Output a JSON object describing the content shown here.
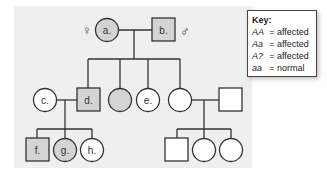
{
  "pedigree": {
    "symbols": {
      "female": "♀",
      "male": "♂"
    },
    "generation1": {
      "a": {
        "label": "a.",
        "sex": "female",
        "affected": true
      },
      "b": {
        "label": "b.",
        "sex": "male",
        "affected": true
      }
    },
    "generation2": [
      {
        "label": "c.",
        "sex": "female",
        "affected": false
      },
      {
        "label": "d.",
        "sex": "male",
        "affected": true
      },
      {
        "label": "",
        "sex": "female",
        "affected": true
      },
      {
        "label": "e.",
        "sex": "female",
        "affected": false
      },
      {
        "label": "",
        "sex": "female",
        "affected": false
      },
      {
        "label": "",
        "sex": "male",
        "affected": false
      }
    ],
    "generation3": [
      {
        "label": "f.",
        "sex": "male",
        "affected": true
      },
      {
        "label": "g.",
        "sex": "female",
        "affected": true
      },
      {
        "label": "h.",
        "sex": "female",
        "affected": false
      },
      {
        "label": "",
        "sex": "male",
        "affected": false
      },
      {
        "label": "",
        "sex": "female",
        "affected": false
      },
      {
        "label": "",
        "sex": "female",
        "affected": false
      }
    ]
  },
  "key": {
    "title": "Key:",
    "rows": [
      {
        "genotype": "AA",
        "eq": "=",
        "phenotype": "affected"
      },
      {
        "genotype": "Aa",
        "eq": "=",
        "phenotype": "affected"
      },
      {
        "genotype": "A?",
        "eq": "=",
        "phenotype": "affected"
      },
      {
        "genotype": "aa",
        "eq": "=",
        "phenotype": "normal"
      }
    ]
  },
  "colors": {
    "affected_fill": "#d4d4d4",
    "unaffected_fill": "#ffffff",
    "stroke": "#333333",
    "panel_bg": "#efefef"
  }
}
